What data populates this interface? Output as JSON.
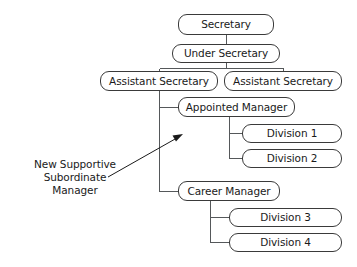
{
  "diagram": {
    "type": "organizational-chart",
    "title": "",
    "background_color": "#ffffff",
    "line_color": "#55585a",
    "box_border_color": "#3a3a3a",
    "text_color": "#1a1a1a",
    "nodes": {
      "secretary": {
        "label": "Secretary",
        "x": 178,
        "y": 14,
        "w": 96,
        "h": 21
      },
      "under_secretary": {
        "label": "Under Secretary",
        "x": 172,
        "y": 44,
        "w": 108,
        "h": 19
      },
      "assistant_secretary_left": {
        "label": "Assistant Secretary",
        "x": 100,
        "y": 71,
        "w": 118,
        "h": 20
      },
      "assistant_secretary_right": {
        "label": "Assistant Secretary",
        "x": 224,
        "y": 71,
        "w": 118,
        "h": 20
      },
      "appointed_manager": {
        "label": "Appointed Manager",
        "x": 178,
        "y": 97,
        "w": 117,
        "h": 20
      },
      "division_1": {
        "label": "Division 1",
        "x": 242,
        "y": 124,
        "w": 100,
        "h": 19
      },
      "division_2": {
        "label": "Division 2",
        "x": 242,
        "y": 149,
        "w": 100,
        "h": 19
      },
      "career_manager": {
        "label": "Career Manager",
        "x": 178,
        "y": 181,
        "w": 102,
        "h": 20
      },
      "division_3": {
        "label": "Division 3",
        "x": 229,
        "y": 208,
        "w": 113,
        "h": 19
      },
      "division_4": {
        "label": "Division 4",
        "x": 229,
        "y": 233,
        "w": 113,
        "h": 19
      }
    },
    "annotation": {
      "line_1": "New Supportive",
      "line_2": "Subordinate",
      "line_3": "Manager",
      "x": 8,
      "y": 158,
      "width": 134,
      "arrow_from_x": 108,
      "arrow_from_y": 177,
      "arrow_to_x": 183,
      "arrow_to_y": 134
    },
    "edges": [
      {
        "from": "secretary",
        "to": "under_secretary",
        "kind": "vertical"
      },
      {
        "from": "under_secretary",
        "to": "assistant_secretary_left",
        "kind": "bus"
      },
      {
        "from": "under_secretary",
        "to": "assistant_secretary_right",
        "kind": "bus"
      },
      {
        "from": "assistant_secretary_left",
        "to": "appointed_manager",
        "kind": "elbow"
      },
      {
        "from": "assistant_secretary_left",
        "to": "career_manager",
        "kind": "elbow"
      },
      {
        "from": "appointed_manager",
        "to": "division_1",
        "kind": "elbow"
      },
      {
        "from": "appointed_manager",
        "to": "division_2",
        "kind": "elbow"
      },
      {
        "from": "career_manager",
        "to": "division_3",
        "kind": "elbow"
      },
      {
        "from": "career_manager",
        "to": "division_4",
        "kind": "elbow"
      }
    ]
  }
}
